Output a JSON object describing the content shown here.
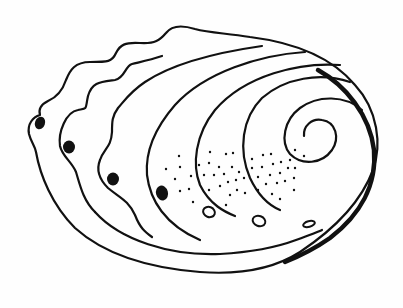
{
  "figure": {
    "subject": "Abalone shell line drawing",
    "colors": {
      "ink": "#111111",
      "background": "#fefefe"
    },
    "respiratory_holes_open": 4,
    "respiratory_holes_closed": 3
  }
}
